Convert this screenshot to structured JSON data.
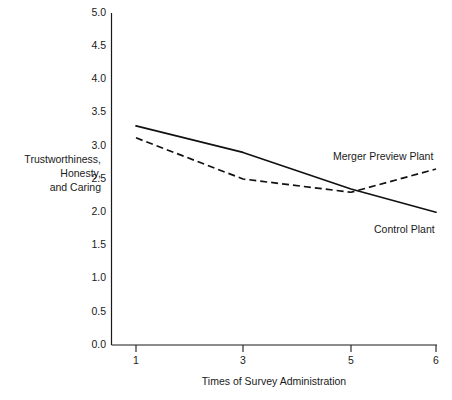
{
  "chart_data": {
    "type": "line",
    "title": "",
    "xlabel": "Times of Survey Administration",
    "ylabel": "Trustworthiness, Honesty, and Caring",
    "ylabel_lines": [
      "Trustworthiness,",
      "Honesty,",
      "and Caring"
    ],
    "x": [
      1,
      3,
      5,
      6
    ],
    "x_tick_labels": [
      "1",
      "3",
      "5",
      "6"
    ],
    "y_tick_labels": [
      "0.0",
      "0.5",
      "1.0",
      "1.5",
      "2.0",
      "2.5",
      "3.0",
      "3.5",
      "4.0",
      "4.5",
      "5.0"
    ],
    "y_tick_values": [
      0.0,
      0.5,
      1.0,
      1.5,
      2.0,
      2.5,
      3.0,
      3.5,
      4.0,
      4.5,
      5.0
    ],
    "ylim": [
      0.0,
      5.0
    ],
    "grid": false,
    "legend_position": "inline-annotations",
    "series": [
      {
        "name": "Control Plant",
        "style": "solid",
        "color": "#111111",
        "values": [
          3.3,
          2.9,
          2.35,
          2.0
        ],
        "label": "Control Plant"
      },
      {
        "name": "Merger Preview Plant",
        "style": "dashed",
        "color": "#111111",
        "values": [
          3.12,
          2.5,
          2.3,
          2.65
        ],
        "label": "Merger Preview Plant"
      }
    ],
    "annotations": [
      {
        "text": "Merger Preview Plant",
        "x_px": 333,
        "y_px": 160
      },
      {
        "text": "Control Plant",
        "x_px": 374,
        "y_px": 233
      }
    ]
  }
}
